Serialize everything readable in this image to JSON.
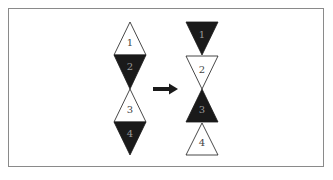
{
  "diagram": {
    "colors": {
      "filled": "#1a1a1a",
      "outline": "#1a1a1a",
      "empty": "#ffffff",
      "frame": "#8a8a8a",
      "label_on_dark": "#9a9a9a",
      "label_on_light": "#444444"
    },
    "before": {
      "triangles": [
        {
          "label": "1",
          "orientation": "up",
          "fill": "white"
        },
        {
          "label": "2",
          "orientation": "down",
          "fill": "black"
        },
        {
          "label": "3",
          "orientation": "up",
          "fill": "white"
        },
        {
          "label": "4",
          "orientation": "down",
          "fill": "black"
        }
      ]
    },
    "arrow": {
      "direction": "right"
    },
    "after": {
      "triangles": [
        {
          "label": "1",
          "orientation": "down",
          "fill": "black"
        },
        {
          "label": "2",
          "orientation": "down",
          "fill": "white"
        },
        {
          "label": "3",
          "orientation": "up",
          "fill": "black"
        },
        {
          "label": "4",
          "orientation": "up",
          "fill": "white"
        }
      ]
    }
  }
}
